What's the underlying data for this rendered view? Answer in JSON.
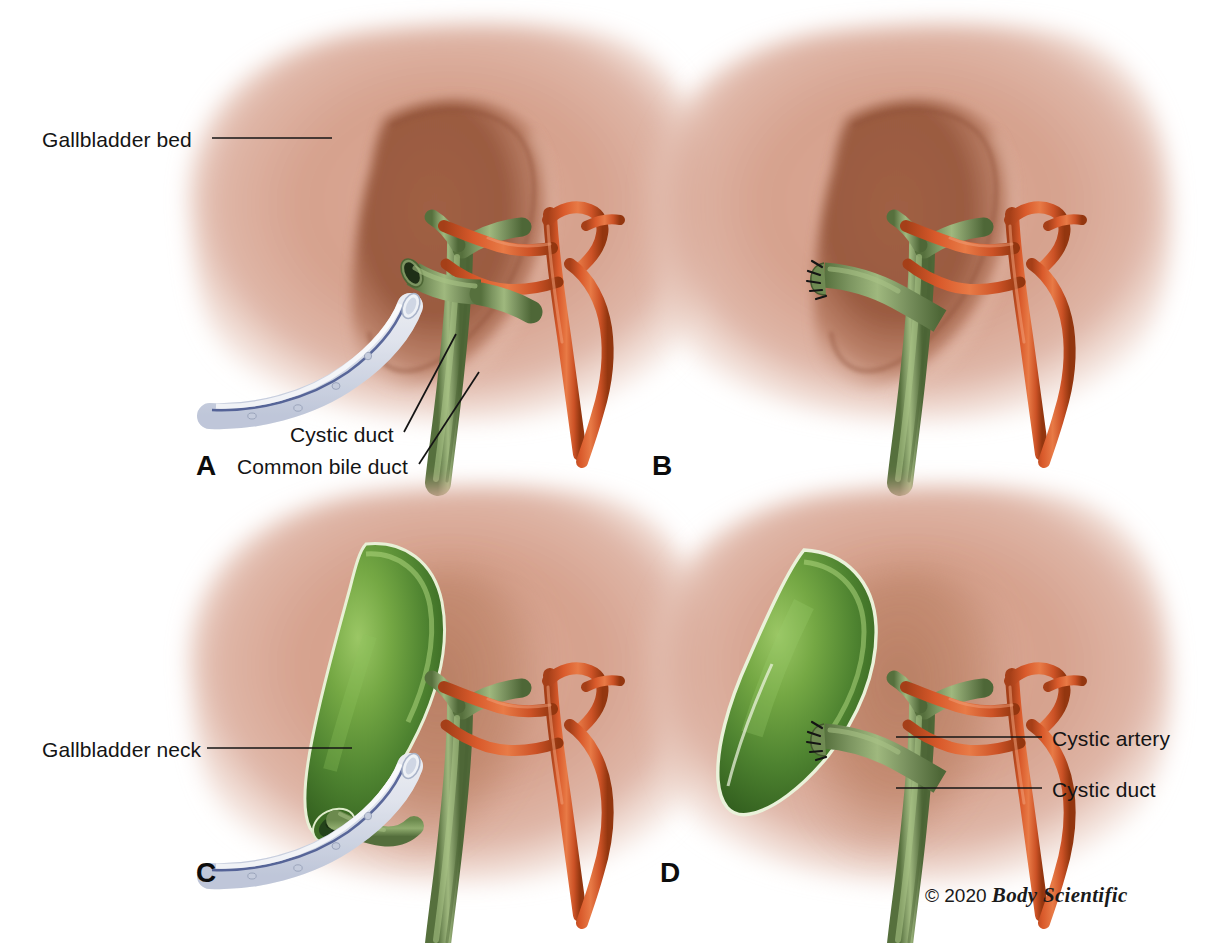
{
  "figure": {
    "background_color": "#ffffff",
    "width": 1206,
    "height": 943
  },
  "colors": {
    "liver_base": "#d9a694",
    "liver_mid": "#c98d79",
    "gallbladder_bed": "#9e5c42",
    "bile_duct_green": "#7d9461",
    "bile_duct_green_dark": "#55703f",
    "bile_duct_highlight": "#a8bd84",
    "artery_red": "#d95a2b",
    "artery_red_dark": "#a8401b",
    "gallbladder_green": "#4f8330",
    "gallbladder_highlight": "#8fbc5e",
    "drain_tube": "#eef1f6",
    "drain_stripe": "#3a4a86",
    "lumen_dark": "#203018",
    "label_text": "#141414",
    "leader_line": "#141414"
  },
  "panels": [
    {
      "id": "A",
      "letter": "A",
      "letter_x": 196,
      "letter_y": 455,
      "description": "Gallbladder removed from bed; cystic duct cut open with drain in place"
    },
    {
      "id": "B",
      "letter": "B",
      "letter_x": 652,
      "letter_y": 455,
      "description": "Cystic duct stump closed with sutures"
    },
    {
      "id": "C",
      "letter": "C",
      "letter_x": 196,
      "letter_y": 870,
      "description": "Gallbladder still attached at neck with drain in place"
    },
    {
      "id": "D",
      "letter": "D",
      "letter_x": 660,
      "letter_y": 870,
      "description": "Gallbladder fully detached; sutured cystic duct stump"
    }
  ],
  "labels": [
    {
      "id": "gallbladder-bed",
      "text": "Gallbladder bed",
      "text_x": 42,
      "text_y": 145,
      "anchor": "start",
      "leader": {
        "x1": 212,
        "y1": 138,
        "x2": 332,
        "y2": 138
      }
    },
    {
      "id": "cystic-duct-a",
      "text": "Cystic duct",
      "text_x": 290,
      "text_y": 440,
      "anchor": "start",
      "leader": {
        "x1": 404,
        "y1": 432,
        "x2": 456,
        "y2": 334
      }
    },
    {
      "id": "common-bile-duct-a",
      "text": "Common bile duct",
      "text_x": 237,
      "text_y": 472,
      "anchor": "start",
      "leader": {
        "x1": 419,
        "y1": 464,
        "x2": 479,
        "y2": 372
      }
    },
    {
      "id": "gallbladder-neck",
      "text": "Gallbladder neck",
      "text_x": 42,
      "text_y": 755,
      "anchor": "start",
      "leader": {
        "x1": 207,
        "y1": 748,
        "x2": 352,
        "y2": 748
      }
    },
    {
      "id": "cystic-artery-d",
      "text": "Cystic artery",
      "text_x": 1052,
      "text_y": 745,
      "anchor": "start",
      "leader": {
        "x1": 896,
        "y1": 737,
        "x2": 1042,
        "y2": 737
      }
    },
    {
      "id": "cystic-duct-d",
      "text": "Cystic duct",
      "text_x": 1052,
      "text_y": 796,
      "anchor": "start",
      "leader": {
        "x1": 896,
        "y1": 788,
        "x2": 1042,
        "y2": 788
      }
    }
  ],
  "credit": {
    "prefix": "© 2020",
    "brand": "Body Scientific",
    "x": 925,
    "y": 895
  }
}
